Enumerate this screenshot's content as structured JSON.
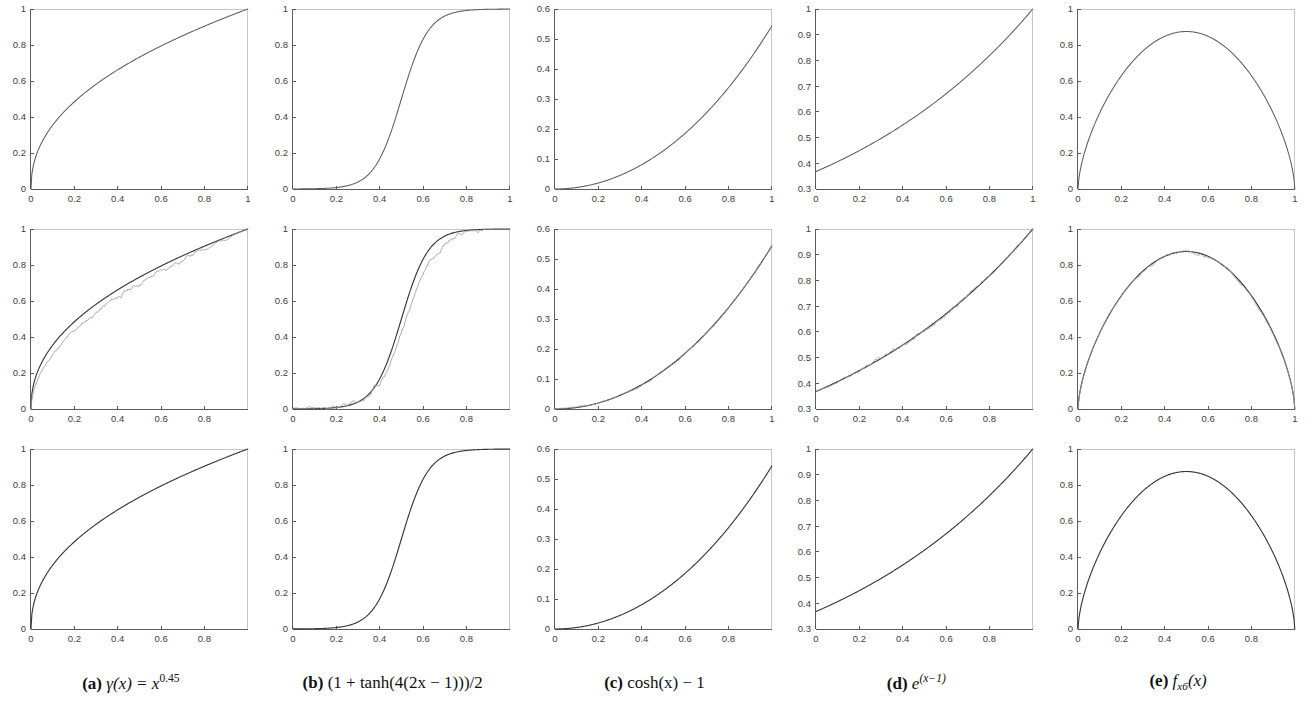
{
  "figure": {
    "rows": 3,
    "cols": 5,
    "row_roles": [
      "target-function",
      "approximation-vs-noisy-sample",
      "learned-approximation"
    ],
    "background_color": "#ffffff",
    "axis_color": "#4a4a4a",
    "curve_color_main": "#5e5e5e",
    "curve_color_approx": "#3a3a3a",
    "curve_color_noisy": "#9a9a9a"
  },
  "captions": [
    {
      "id": "a",
      "label": "(a)",
      "text": "γ(x) = x^0.45",
      "func": "gamma",
      "base": "γ(x) = x",
      "exp": "0.45"
    },
    {
      "id": "b",
      "label": "(b)",
      "text": "(1 + tanh(4(2x − 1)))/2",
      "func": "tanh"
    },
    {
      "id": "c",
      "label": "(c)",
      "text": "cosh(x) − 1",
      "func": "cosh"
    },
    {
      "id": "d",
      "label": "(d)",
      "text": "e^(x−1)",
      "func": "exp",
      "base": "e",
      "exp": "(x−1)"
    },
    {
      "id": "e",
      "label": "(e)",
      "text": "f x6 (x)",
      "func": "fx6",
      "base": "f",
      "sub": "x6",
      "tail": "(x)"
    }
  ],
  "chart_data": [
    {
      "panel": "a-top",
      "row": 0,
      "col": 0,
      "type": "line",
      "title": "",
      "xlabel": "",
      "ylabel": "",
      "xlim": [
        0,
        1
      ],
      "ylim": [
        0,
        1
      ],
      "grid": false,
      "legend": null,
      "xticks": [
        0,
        0.2,
        0.4,
        0.6,
        0.8,
        1
      ],
      "xticklabels": [
        "0",
        "0.2",
        "0.4",
        "0.6",
        "0.8",
        "1"
      ],
      "yticks": [
        0,
        0.2,
        0.4,
        0.6,
        0.8,
        1
      ],
      "yticklabels": [
        "0",
        "0.2",
        "0.4",
        "0.6",
        "0.8",
        "1"
      ],
      "series": [
        {
          "name": "gamma(x) = x^0.45",
          "kind": "main",
          "formula": "pow",
          "p": 0.45,
          "x": [
            0,
            0.02,
            0.05,
            0.1,
            0.15,
            0.2,
            0.3,
            0.4,
            0.5,
            0.6,
            0.7,
            0.8,
            0.9,
            1
          ],
          "values": [
            0,
            0.172,
            0.261,
            0.357,
            0.427,
            0.488,
            0.589,
            0.669,
            0.732,
            0.787,
            0.834,
            0.878,
            0.954,
            1
          ]
        }
      ]
    },
    {
      "panel": "b-top",
      "row": 0,
      "col": 1,
      "type": "line",
      "xlim": [
        0,
        1
      ],
      "ylim": [
        0,
        1
      ],
      "grid": false,
      "legend": null,
      "xticks": [
        0,
        0.2,
        0.4,
        0.6,
        0.8,
        1
      ],
      "xticklabels": [
        "0",
        "0.2",
        "0.4",
        "0.6",
        "0.8",
        "1"
      ],
      "yticks": [
        0,
        0.2,
        0.4,
        0.6,
        0.8,
        1
      ],
      "yticklabels": [
        "0",
        "0.2",
        "0.4",
        "0.6",
        "0.8",
        "1"
      ],
      "series": [
        {
          "name": "(1+tanh(4(2x-1)))/2",
          "kind": "main",
          "formula": "tanh",
          "k": 8,
          "x": [
            0,
            0.1,
            0.2,
            0.3,
            0.4,
            0.45,
            0.5,
            0.55,
            0.6,
            0.7,
            0.8,
            0.9,
            1
          ],
          "values": [
            0.0002,
            0.0009,
            0.004,
            0.018,
            0.081,
            0.154,
            0.5,
            0.846,
            0.919,
            0.982,
            0.996,
            0.999,
            1
          ]
        }
      ]
    },
    {
      "panel": "c-top",
      "row": 0,
      "col": 2,
      "type": "line",
      "xlim": [
        0,
        1
      ],
      "ylim": [
        0,
        0.6
      ],
      "grid": false,
      "legend": null,
      "xticks": [
        0,
        0.2,
        0.4,
        0.6,
        0.8,
        1
      ],
      "xticklabels": [
        "0",
        "0.2",
        "0.4",
        "0.6",
        "0.8",
        "1"
      ],
      "yticks": [
        0,
        0.1,
        0.2,
        0.3,
        0.4,
        0.5,
        0.6
      ],
      "yticklabels": [
        "0",
        "0.1",
        "0.2",
        "0.3",
        "0.4",
        "0.5",
        "0.6"
      ],
      "series": [
        {
          "name": "cosh(x)-1",
          "kind": "main",
          "formula": "cosh",
          "x": [
            0,
            0.1,
            0.2,
            0.3,
            0.4,
            0.5,
            0.6,
            0.7,
            0.8,
            0.9,
            1
          ],
          "values": [
            0,
            0.005,
            0.02,
            0.045,
            0.081,
            0.128,
            0.186,
            0.255,
            0.337,
            0.433,
            0.543
          ]
        }
      ]
    },
    {
      "panel": "d-top",
      "row": 0,
      "col": 3,
      "type": "line",
      "xlim": [
        0,
        1
      ],
      "ylim": [
        0.3,
        1
      ],
      "grid": false,
      "legend": null,
      "xticks": [
        0,
        0.2,
        0.4,
        0.6,
        0.8,
        1
      ],
      "xticklabels": [
        "0",
        "0.2",
        "0.4",
        "0.6",
        "0.8",
        "1"
      ],
      "yticks": [
        0.3,
        0.4,
        0.5,
        0.6,
        0.7,
        0.8,
        0.9,
        1
      ],
      "yticklabels": [
        "0.3",
        "0.4",
        "0.5",
        "0.6",
        "0.7",
        "0.8",
        "0.9",
        "1"
      ],
      "series": [
        {
          "name": "e^(x-1)",
          "kind": "main",
          "formula": "exp",
          "x": [
            0,
            0.1,
            0.2,
            0.3,
            0.4,
            0.5,
            0.6,
            0.7,
            0.8,
            0.9,
            1
          ],
          "values": [
            0.368,
            0.407,
            0.449,
            0.497,
            0.549,
            0.607,
            0.67,
            0.741,
            0.819,
            0.905,
            1
          ]
        }
      ]
    },
    {
      "panel": "e-top",
      "row": 0,
      "col": 4,
      "type": "line",
      "xlim": [
        0,
        1
      ],
      "ylim": [
        0,
        1
      ],
      "grid": false,
      "legend": null,
      "xticks": [
        0,
        0.2,
        0.4,
        0.6,
        0.8,
        1
      ],
      "xticklabels": [
        "0",
        "0.2",
        "0.4",
        "0.6",
        "0.8",
        "1"
      ],
      "yticks": [
        0,
        0.2,
        0.4,
        0.6,
        0.8,
        1
      ],
      "yticklabels": [
        "0",
        "0.2",
        "0.4",
        "0.6",
        "0.8",
        "1"
      ],
      "series": [
        {
          "name": "f_x6(x)",
          "kind": "main",
          "formula": "bump",
          "peak": 0.875,
          "x": [
            0,
            0.05,
            0.1,
            0.2,
            0.3,
            0.4,
            0.5,
            0.6,
            0.7,
            0.8,
            0.9,
            0.95,
            1
          ],
          "values": [
            0,
            0.27,
            0.44,
            0.66,
            0.79,
            0.86,
            0.875,
            0.86,
            0.79,
            0.66,
            0.44,
            0.27,
            0
          ]
        }
      ]
    },
    {
      "panel": "a-mid",
      "row": 1,
      "col": 0,
      "type": "line",
      "xlim": [
        0,
        1
      ],
      "ylim": [
        0,
        1
      ],
      "grid": false,
      "legend": null,
      "xticks": [
        0,
        0.2,
        0.4,
        0.6,
        0.8
      ],
      "xticklabels": [
        "0",
        "0.2",
        "0.4",
        "0.6",
        "0.8"
      ],
      "yticks": [
        0,
        0.2,
        0.4,
        0.6,
        0.8,
        1
      ],
      "yticklabels": [
        "0",
        "0.2",
        "0.4",
        "0.6",
        "0.8",
        "1"
      ],
      "series": [
        {
          "name": "gamma(x) = x^0.45",
          "kind": "approx",
          "formula": "pow",
          "p": 0.45
        },
        {
          "name": "noisy estimate",
          "kind": "noisy",
          "formula": "pow",
          "p": 0.52,
          "noise": 0.012,
          "seed": 11
        }
      ]
    },
    {
      "panel": "b-mid",
      "row": 1,
      "col": 1,
      "type": "line",
      "xlim": [
        0,
        1
      ],
      "ylim": [
        0,
        1
      ],
      "grid": false,
      "legend": null,
      "xticks": [
        0,
        0.2,
        0.4,
        0.6,
        0.8
      ],
      "xticklabels": [
        "0",
        "0.2",
        "0.4",
        "0.6",
        "0.8"
      ],
      "yticks": [
        0,
        0.2,
        0.4,
        0.6,
        0.8,
        1
      ],
      "yticklabels": [
        "0",
        "0.2",
        "0.4",
        "0.6",
        "0.8",
        "1"
      ],
      "series": [
        {
          "name": "(1+tanh(4(2x-1)))/2",
          "kind": "approx",
          "formula": "tanh",
          "k": 8
        },
        {
          "name": "noisy estimate",
          "kind": "noisy",
          "formula": "tanh",
          "k": 7.3,
          "shift": -0.022,
          "noise": 0.016,
          "seed": 23
        }
      ]
    },
    {
      "panel": "c-mid",
      "row": 1,
      "col": 2,
      "type": "line",
      "xlim": [
        0,
        1
      ],
      "ylim": [
        0,
        0.6
      ],
      "grid": false,
      "legend": null,
      "xticks": [
        0,
        0.2,
        0.4,
        0.6,
        0.8,
        1
      ],
      "xticklabels": [
        "0",
        "0.2",
        "0.4",
        "0.6",
        "0.8",
        "1"
      ],
      "yticks": [
        0,
        0.1,
        0.2,
        0.3,
        0.4,
        0.5,
        0.6
      ],
      "yticklabels": [
        "0",
        "0.1",
        "0.2",
        "0.3",
        "0.4",
        "0.5",
        "0.6"
      ],
      "series": [
        {
          "name": "cosh(x)-1",
          "kind": "approx",
          "formula": "cosh"
        },
        {
          "name": "noisy estimate",
          "kind": "noisy",
          "formula": "cosh",
          "noise": 0.006,
          "seed": 37
        }
      ]
    },
    {
      "panel": "d-mid",
      "row": 1,
      "col": 3,
      "type": "line",
      "xlim": [
        0,
        1
      ],
      "ylim": [
        0.3,
        1
      ],
      "grid": false,
      "legend": null,
      "xticks": [
        0,
        0.2,
        0.4,
        0.6,
        0.8
      ],
      "xticklabels": [
        "0",
        "0.2",
        "0.4",
        "0.6",
        "0.8"
      ],
      "yticks": [
        0.3,
        0.4,
        0.5,
        0.6,
        0.7,
        0.8,
        0.9,
        1
      ],
      "yticklabels": [
        "0.3",
        "0.4",
        "0.5",
        "0.6",
        "0.7",
        "0.8",
        "0.9",
        "1"
      ],
      "series": [
        {
          "name": "e^(x-1)",
          "kind": "approx",
          "formula": "exp"
        },
        {
          "name": "noisy estimate",
          "kind": "noisy",
          "formula": "exp",
          "noise": 0.011,
          "seed": 53
        }
      ]
    },
    {
      "panel": "e-mid",
      "row": 1,
      "col": 4,
      "type": "line",
      "xlim": [
        0,
        1
      ],
      "ylim": [
        0,
        1
      ],
      "grid": false,
      "legend": null,
      "xticks": [
        0,
        0.2,
        0.4,
        0.6,
        0.8,
        1
      ],
      "xticklabels": [
        "0",
        "0.2",
        "0.4",
        "0.6",
        "0.8",
        "1"
      ],
      "yticks": [
        0,
        0.2,
        0.4,
        0.6,
        0.8,
        1
      ],
      "yticklabels": [
        "0",
        "0.2",
        "0.4",
        "0.6",
        "0.8",
        "1"
      ],
      "series": [
        {
          "name": "f_x6(x)",
          "kind": "approx",
          "formula": "bump",
          "peak": 0.875
        },
        {
          "name": "noisy estimate",
          "kind": "noisy",
          "formula": "bump",
          "peak": 0.872,
          "noise": 0.008,
          "seed": 71
        }
      ]
    },
    {
      "panel": "a-bot",
      "row": 2,
      "col": 0,
      "type": "line",
      "xlim": [
        0,
        1
      ],
      "ylim": [
        0,
        1
      ],
      "grid": false,
      "legend": null,
      "xticks": [
        0,
        0.2,
        0.4,
        0.6,
        0.8
      ],
      "xticklabels": [
        "0",
        "0.2",
        "0.4",
        "0.6",
        "0.8"
      ],
      "yticks": [
        0,
        0.2,
        0.4,
        0.6,
        0.8,
        1
      ],
      "yticklabels": [
        "0",
        "0.2",
        "0.4",
        "0.6",
        "0.8",
        "1"
      ],
      "series": [
        {
          "name": "gamma(x) = x^0.45",
          "kind": "approx",
          "formula": "pow",
          "p": 0.45
        }
      ]
    },
    {
      "panel": "b-bot",
      "row": 2,
      "col": 1,
      "type": "line",
      "xlim": [
        0,
        1
      ],
      "ylim": [
        0,
        1
      ],
      "grid": false,
      "legend": null,
      "xticks": [
        0,
        0.2,
        0.4,
        0.6,
        0.8
      ],
      "xticklabels": [
        "0",
        "0.2",
        "0.4",
        "0.6",
        "0.8"
      ],
      "yticks": [
        0,
        0.2,
        0.4,
        0.6,
        0.8,
        1
      ],
      "yticklabels": [
        "0",
        "0.2",
        "0.4",
        "0.6",
        "0.8",
        "1"
      ],
      "series": [
        {
          "name": "(1+tanh(4(2x-1)))/2",
          "kind": "approx",
          "formula": "tanh",
          "k": 8
        }
      ]
    },
    {
      "panel": "c-bot",
      "row": 2,
      "col": 2,
      "type": "line",
      "xlim": [
        0,
        1
      ],
      "ylim": [
        0,
        0.6
      ],
      "grid": false,
      "legend": null,
      "xticks": [
        0,
        0.2,
        0.4,
        0.6,
        0.8
      ],
      "xticklabels": [
        "0",
        "0.2",
        "0.4",
        "0.6",
        "0.8"
      ],
      "yticks": [
        0,
        0.1,
        0.2,
        0.3,
        0.4,
        0.5,
        0.6
      ],
      "yticklabels": [
        "0",
        "0.1",
        "0.2",
        "0.3",
        "0.4",
        "0.5",
        "0.6"
      ],
      "series": [
        {
          "name": "cosh(x)-1",
          "kind": "approx",
          "formula": "cosh"
        }
      ]
    },
    {
      "panel": "d-bot",
      "row": 2,
      "col": 3,
      "type": "line",
      "xlim": [
        0,
        1
      ],
      "ylim": [
        0.3,
        1
      ],
      "grid": false,
      "legend": null,
      "xticks": [
        0,
        0.2,
        0.4,
        0.6,
        0.8
      ],
      "xticklabels": [
        "0",
        "0.2",
        "0.4",
        "0.6",
        "0.8"
      ],
      "yticks": [
        0.3,
        0.4,
        0.5,
        0.6,
        0.7,
        0.8,
        0.9,
        1
      ],
      "yticklabels": [
        "0.3",
        "0.4",
        "0.5",
        "0.6",
        "0.7",
        "0.8",
        "0.9",
        "1"
      ],
      "series": [
        {
          "name": "e^(x-1)",
          "kind": "approx",
          "formula": "exp"
        }
      ]
    },
    {
      "panel": "e-bot",
      "row": 2,
      "col": 4,
      "type": "line",
      "xlim": [
        0,
        1
      ],
      "ylim": [
        0,
        1
      ],
      "grid": false,
      "legend": null,
      "xticks": [
        0,
        0.2,
        0.4,
        0.6,
        0.8
      ],
      "xticklabels": [
        "0",
        "0.2",
        "0.4",
        "0.6",
        "0.8"
      ],
      "yticks": [
        0,
        0.2,
        0.4,
        0.6,
        0.8,
        1
      ],
      "yticklabels": [
        "0",
        "0.2",
        "0.4",
        "0.6",
        "0.8",
        "1"
      ],
      "series": [
        {
          "name": "f_x6(x)",
          "kind": "approx",
          "formula": "bump",
          "peak": 0.875
        }
      ]
    }
  ]
}
